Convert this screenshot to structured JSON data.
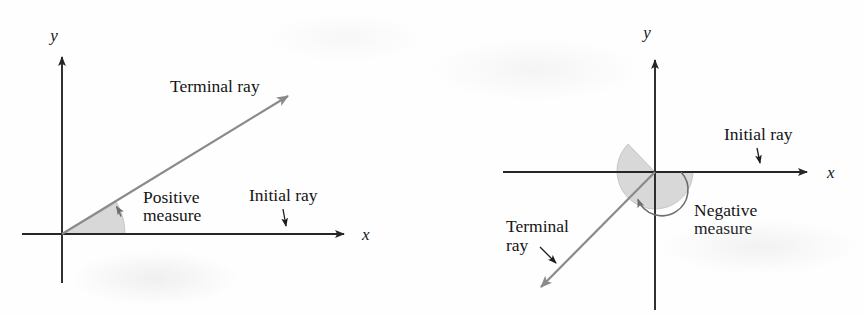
{
  "figure": {
    "background_color": "#fefefe",
    "axis_color": "#262626",
    "ray_color": "#808080",
    "sector_fill_color": "#d8d8d8",
    "sector_stroke_color": "#9a9a9a",
    "text_color": "#141414"
  },
  "panels": [
    {
      "id": "positive-angle-panel",
      "name": "positive-measure-diagram",
      "origin": {
        "x": 62,
        "y": 234
      },
      "axes": {
        "x": {
          "label": "x",
          "label_x": 362,
          "label_y": 240,
          "start_x": 22,
          "end_x": 350,
          "y": 234
        },
        "y": {
          "label": "y",
          "label_x": 54,
          "label_y": 41,
          "start_y": 283,
          "end_y": 50,
          "x": 62
        }
      },
      "terminal_ray": {
        "label": "Terminal ray",
        "label_x": 170,
        "label_y": 92,
        "tip_x": 296,
        "tip_y": 90,
        "angle_deg": 30
      },
      "initial_ray": {
        "label": "Initial ray",
        "label_x": 249,
        "label_y": 201,
        "pointer_from_x": 283,
        "pointer_from_y": 209,
        "pointer_to_x": 287,
        "pointer_to_y": 231
      },
      "measure": {
        "line1": "Positive",
        "line2": "measure",
        "label_x": 143,
        "label_y1": 203,
        "label_y2": 221,
        "sector_radius": 63,
        "sweep_start_deg": 0,
        "sweep_end_deg": 30,
        "direction": "counterclockwise"
      }
    },
    {
      "id": "negative-angle-panel",
      "name": "negative-measure-diagram",
      "origin": {
        "x": 655,
        "y": 172
      },
      "axes": {
        "x": {
          "label": "x",
          "label_x": 827,
          "label_y": 178,
          "start_x": 503,
          "end_x": 813,
          "y": 172
        },
        "y": {
          "label": "y",
          "label_x": 647,
          "label_y": 38,
          "start_y": 310,
          "end_y": 53,
          "x": 655
        }
      },
      "terminal_ray": {
        "label_line1": "Terminal",
        "label_line2": "ray",
        "label_x": 506,
        "label_y1": 232,
        "label_y2": 251,
        "tip_x": 533,
        "tip_y": 295,
        "angle_deg": -135,
        "pointer_from_x": 540,
        "pointer_from_y": 247,
        "pointer_to_x": 561,
        "pointer_to_y": 268
      },
      "initial_ray": {
        "label": "Initial ray",
        "label_x": 724,
        "label_y": 140,
        "pointer_from_x": 757,
        "pointer_from_y": 148,
        "pointer_to_x": 761,
        "pointer_to_y": 168
      },
      "measure": {
        "line1": "Negative",
        "line2": "measure",
        "label_x": 694,
        "label_y1": 216,
        "label_y2": 234,
        "sector_radius": 38,
        "sweep_start_deg": 0,
        "sweep_end_deg": -225,
        "direction": "clockwise"
      }
    }
  ]
}
